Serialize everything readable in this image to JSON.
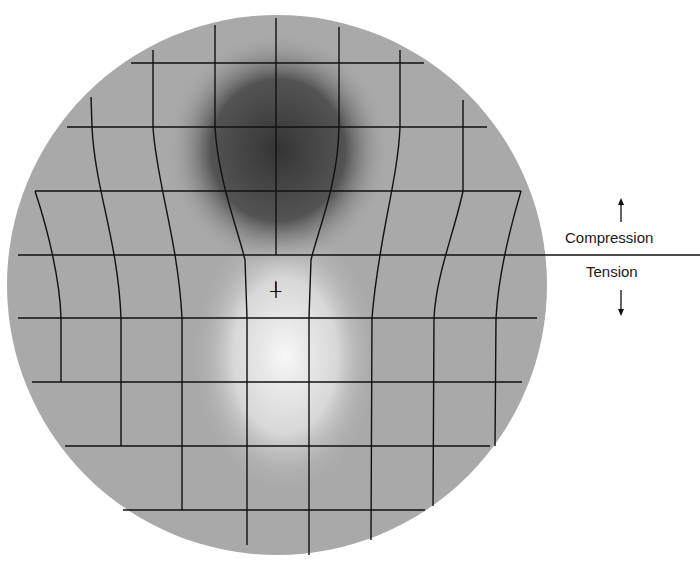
{
  "diagram": {
    "dislocation_symbol": "⊥",
    "labels": {
      "compression": "Compression",
      "tension": "Tension"
    },
    "arrows": {
      "compression": "up-arrow",
      "tension": "down-arrow"
    },
    "colors": {
      "background": "#ffffff",
      "disc": "#a9a9a9",
      "compression_region": "#3a3a3a",
      "tension_region": "#efefef",
      "grid_lines": "#111111"
    },
    "disc": {
      "cx": 277,
      "cy": 285,
      "r": 270
    },
    "regions": {
      "compression": {
        "cx": 278,
        "cy": 148,
        "rx": 100,
        "ry": 105
      },
      "tension": {
        "cx": 285,
        "cy": 370,
        "rx": 85,
        "ry": 130
      }
    },
    "divider_line": {
      "x1": 18,
      "x2": 700,
      "y": 255
    },
    "horizontal_lines": [
      {
        "y": 63,
        "x1": 131,
        "x2": 424
      },
      {
        "y": 127,
        "x1": 67,
        "x2": 487
      },
      {
        "y": 191,
        "x1": 35,
        "x2": 521
      },
      {
        "y": 318,
        "x1": 18,
        "x2": 537
      },
      {
        "y": 382,
        "x1": 32,
        "x2": 522
      },
      {
        "y": 446,
        "x1": 65,
        "x2": 490
      },
      {
        "y": 510,
        "x1": 123,
        "x2": 425
      }
    ],
    "vertical_lines": [
      {
        "d": "M 35 191 C 48 230 60 280 61 318 L 61 382"
      },
      {
        "d": "M 91 97 L 92 127 C 95 190 118 240 121 318 L 121 446"
      },
      {
        "d": "M 153 50 L 153 127 C 156 180 178 240 182 318 L 182 510"
      },
      {
        "d": "M 215 25 L 215 127 C 218 180 238 230 245 260 L 247 318 L 247 545"
      },
      {
        "d": "M 276 18 L 276 255"
      },
      {
        "d": "M 276 282 L 276 298"
      },
      {
        "d": "M 339 27 L 339 127 C 338 185 318 230 311 260 L 309 318 L 309 555"
      },
      {
        "d": "M 400 50 L 400 127 C 398 180 378 240 372 318 L 371 540"
      },
      {
        "d": "M 463 100 L 463 191 C 455 230 436 275 434 318 L 433 506"
      },
      {
        "d": "M 521 191 C 508 235 498 280 496 318 L 495 446"
      }
    ],
    "dislocation": {
      "x": 276,
      "y": 292
    },
    "arrow_positions": {
      "up": {
        "x": 621,
        "y1": 222,
        "y2": 198
      },
      "down": {
        "x": 621,
        "y1": 290,
        "y2": 316
      }
    }
  }
}
